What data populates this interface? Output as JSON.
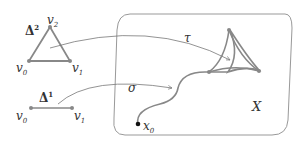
{
  "diagram": {
    "type": "simplices-mapping-into-space",
    "colors": {
      "simplex": "#888888",
      "arrow": "#777777",
      "region": "#999999",
      "text": "#333333",
      "base_point": "#111111"
    },
    "simplex2": {
      "label": "Δ",
      "label_sup": "2",
      "vertices": [
        {
          "name": "v",
          "sub": "0"
        },
        {
          "name": "v",
          "sub": "1"
        },
        {
          "name": "v",
          "sub": "2"
        }
      ]
    },
    "simplex1": {
      "label": "Δ",
      "label_sup": "1",
      "vertices": [
        {
          "name": "v",
          "sub": "0"
        },
        {
          "name": "v",
          "sub": "1"
        }
      ]
    },
    "maps": {
      "tau": "τ",
      "sigma": "σ"
    },
    "space": {
      "label": "X",
      "base_point": {
        "name": "x",
        "sub": "0"
      }
    }
  }
}
